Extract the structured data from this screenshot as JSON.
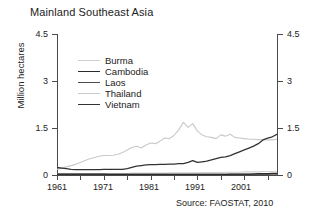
{
  "title": "Mainland Southeast Asia",
  "source_note": "Source: FAOSTAT, 2010",
  "axes": {
    "ylabel": "Million hectares",
    "yticks": [
      "0",
      "1.5",
      "3",
      "4.5"
    ],
    "yticks_right": [
      "0",
      "1.5",
      "3",
      "4.5"
    ],
    "xticks": [
      "1961",
      "1971",
      "1981",
      "1991",
      "2001"
    ]
  },
  "legend": {
    "items": [
      {
        "label": "Burma",
        "color": "#cfcfcf",
        "width": 1.1
      },
      {
        "label": "Cambodia",
        "color": "#2b2b2b",
        "width": 1.4
      },
      {
        "label": "Laos",
        "color": "#4d4d4d",
        "width": 1.3
      },
      {
        "label": "Thailand",
        "color": "#c9c9c9",
        "width": 1.1
      },
      {
        "label": "Vietnam",
        "color": "#333333",
        "width": 1.4
      }
    ]
  },
  "chart_data": {
    "type": "line",
    "title": "Mainland Southeast Asia",
    "xlabel": "",
    "ylabel": "Million hectares",
    "xlim": [
      1961,
      2008
    ],
    "ylim": [
      0,
      4.5
    ],
    "yticks": [
      0,
      1.5,
      3,
      4.5
    ],
    "xticks": [
      1961,
      1971,
      1981,
      1991,
      2001
    ],
    "grid": false,
    "legend_position": "upper-left-inside",
    "annotation": "Source: FAOSTAT, 2010",
    "x": [
      1961,
      1962,
      1963,
      1964,
      1965,
      1966,
      1967,
      1968,
      1969,
      1970,
      1971,
      1972,
      1973,
      1974,
      1975,
      1976,
      1977,
      1978,
      1979,
      1980,
      1981,
      1982,
      1983,
      1984,
      1985,
      1986,
      1987,
      1988,
      1989,
      1990,
      1991,
      1992,
      1993,
      1994,
      1995,
      1996,
      1997,
      1998,
      1999,
      2000,
      2001,
      2002,
      2003,
      2004,
      2005,
      2006,
      2007,
      2008
    ],
    "series": [
      {
        "name": "Burma",
        "color": "#cfcfcf",
        "values": [
          0.04,
          0.04,
          0.04,
          0.04,
          0.05,
          0.05,
          0.05,
          0.05,
          0.05,
          0.05,
          0.05,
          0.05,
          0.05,
          0.05,
          0.05,
          0.05,
          0.06,
          0.06,
          0.06,
          0.06,
          0.06,
          0.06,
          0.06,
          0.06,
          0.07,
          0.07,
          0.07,
          0.07,
          0.07,
          0.07,
          0.07,
          0.08,
          0.08,
          0.08,
          0.08,
          0.08,
          0.09,
          0.09,
          0.09,
          0.09,
          0.1,
          0.1,
          0.1,
          0.1,
          0.11,
          0.11,
          0.11,
          0.12
        ]
      },
      {
        "name": "Cambodia",
        "color": "#2b2b2b",
        "values": [
          0.03,
          0.03,
          0.03,
          0.03,
          0.03,
          0.03,
          0.03,
          0.03,
          0.03,
          0.03,
          0.03,
          0.02,
          0.02,
          0.02,
          0.02,
          0.02,
          0.02,
          0.02,
          0.02,
          0.02,
          0.02,
          0.02,
          0.02,
          0.02,
          0.02,
          0.02,
          0.02,
          0.02,
          0.02,
          0.02,
          0.02,
          0.02,
          0.02,
          0.02,
          0.02,
          0.02,
          0.02,
          0.03,
          0.03,
          0.03,
          0.03,
          0.03,
          0.03,
          0.04,
          0.04,
          0.04,
          0.05,
          0.05
        ]
      },
      {
        "name": "Laos",
        "color": "#4d4d4d",
        "values": [
          0.02,
          0.02,
          0.02,
          0.02,
          0.02,
          0.02,
          0.02,
          0.02,
          0.02,
          0.02,
          0.02,
          0.02,
          0.02,
          0.02,
          0.02,
          0.02,
          0.02,
          0.02,
          0.02,
          0.02,
          0.02,
          0.02,
          0.02,
          0.02,
          0.02,
          0.02,
          0.02,
          0.02,
          0.02,
          0.02,
          0.02,
          0.02,
          0.02,
          0.02,
          0.02,
          0.02,
          0.02,
          0.02,
          0.02,
          0.02,
          0.02,
          0.02,
          0.03,
          0.03,
          0.03,
          0.03,
          0.03,
          0.03
        ]
      },
      {
        "name": "Thailand",
        "color": "#c9c9c9",
        "values": [
          0.18,
          0.22,
          0.26,
          0.3,
          0.34,
          0.4,
          0.46,
          0.52,
          0.56,
          0.6,
          0.62,
          0.62,
          0.63,
          0.66,
          0.72,
          0.8,
          0.88,
          0.92,
          0.86,
          0.96,
          1.02,
          1.0,
          1.08,
          1.18,
          1.16,
          1.26,
          1.44,
          1.68,
          1.52,
          1.64,
          1.4,
          1.28,
          1.22,
          1.2,
          1.16,
          1.28,
          1.24,
          1.3,
          1.2,
          1.18,
          1.16,
          1.14,
          1.14,
          1.13,
          1.12,
          1.12,
          1.12,
          1.14
        ]
      },
      {
        "name": "Vietnam",
        "color": "#333333",
        "values": [
          0.24,
          0.22,
          0.2,
          0.18,
          0.17,
          0.17,
          0.17,
          0.17,
          0.17,
          0.17,
          0.18,
          0.18,
          0.18,
          0.18,
          0.18,
          0.2,
          0.24,
          0.28,
          0.3,
          0.32,
          0.33,
          0.33,
          0.34,
          0.34,
          0.35,
          0.35,
          0.36,
          0.36,
          0.4,
          0.46,
          0.4,
          0.42,
          0.44,
          0.48,
          0.52,
          0.56,
          0.58,
          0.62,
          0.68,
          0.74,
          0.8,
          0.86,
          0.92,
          1.0,
          1.12,
          1.18,
          1.22,
          1.3
        ]
      }
    ]
  }
}
